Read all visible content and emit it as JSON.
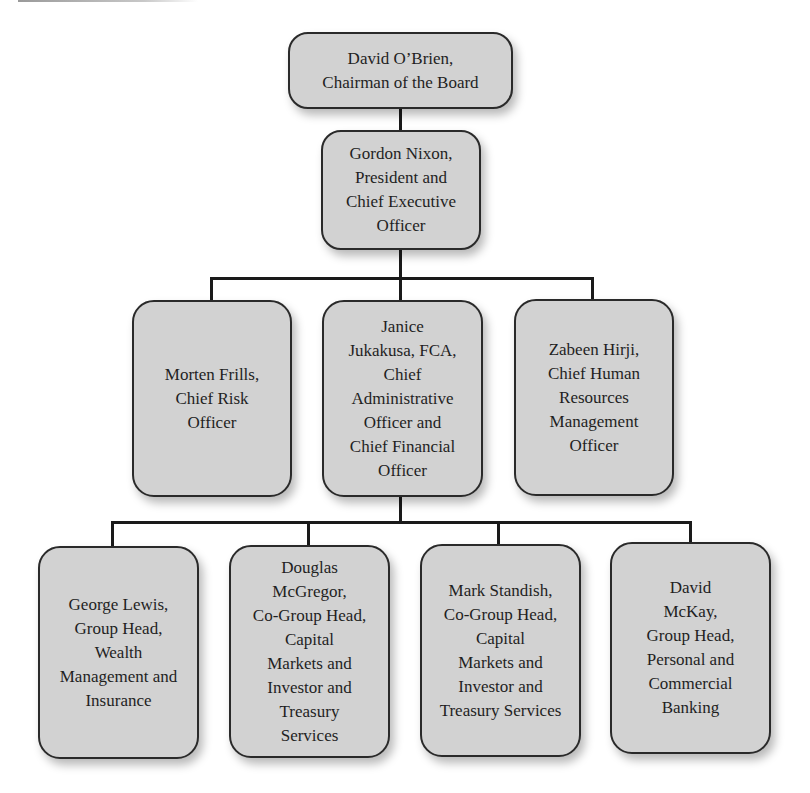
{
  "chart_title": "",
  "org_chart": {
    "level0": {
      "name": "David O’Brien",
      "label": "David O’Brien,\nChairman of the Board",
      "title": "Chairman of the Board"
    },
    "level1": {
      "name": "Gordon Nixon",
      "label": "Gordon Nixon,\nPresident and\nChief Executive\nOfficer",
      "title": "President and Chief Executive Officer"
    },
    "level2": [
      {
        "name": "Morten Frills",
        "label": "Morten Frills,\nChief Risk\nOfficer",
        "title": "Chief Risk Officer"
      },
      {
        "name": "Janice Jukakusa, FCA",
        "label": "Janice\nJukakusa, FCA,\nChief\nAdministrative\nOfficer and\nChief Financial\nOfficer",
        "title": "Chief Administrative Officer and Chief Financial Officer"
      },
      {
        "name": "Zabeen Hirji",
        "label": "Zabeen Hirji,\nChief Human\nResources\nManagement\nOfficer",
        "title": "Chief Human Resources Management Officer"
      }
    ],
    "level3": [
      {
        "name": "George Lewis",
        "label": "George Lewis,\nGroup Head,\nWealth\nManagement and\nInsurance",
        "title": "Group Head, Wealth Management and Insurance"
      },
      {
        "name": "Douglas McGregor",
        "label": "Douglas\nMcGregor,\nCo-Group Head,\nCapital\nMarkets and\nInvestor and\nTreasury\nServices",
        "title": "Co-Group Head, Capital Markets and Investor and Treasury Services"
      },
      {
        "name": "Mark Standish",
        "label": "Mark Standish,\nCo-Group Head,\nCapital\nMarkets and\nInvestor and\nTreasury Services",
        "title": "Co-Group Head, Capital Markets and Investor and Treasury Services"
      },
      {
        "name": "David McKay",
        "label": "David\nMcKay,\nGroup Head,\nPersonal and\nCommercial\nBanking",
        "title": "Group Head, Personal and Commercial Banking"
      }
    ],
    "reporting": [
      {
        "from": "Gordon Nixon",
        "to": "David O’Brien"
      },
      {
        "from": "Morten Frills",
        "to": "Gordon Nixon"
      },
      {
        "from": "Janice Jukakusa, FCA",
        "to": "Gordon Nixon"
      },
      {
        "from": "Zabeen Hirji",
        "to": "Gordon Nixon"
      },
      {
        "from": "George Lewis",
        "to": "Janice Jukakusa, FCA"
      },
      {
        "from": "Douglas McGregor",
        "to": "Janice Jukakusa, FCA"
      },
      {
        "from": "Mark Standish",
        "to": "Janice Jukakusa, FCA"
      },
      {
        "from": "David McKay",
        "to": "Janice Jukakusa, FCA"
      }
    ]
  },
  "colors": {
    "box_fill": "#d2d2d2",
    "box_border": "#2a2a2a",
    "connector": "#1a1a1a",
    "text": "#1f1f1f",
    "background": "#ffffff"
  }
}
